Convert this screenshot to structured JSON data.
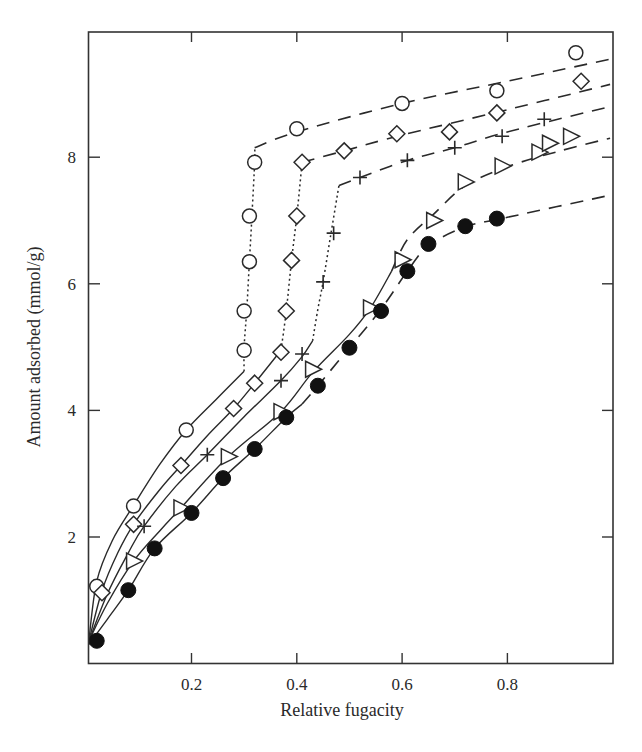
{
  "chart_data": {
    "type": "scatter",
    "title": "",
    "xlabel": "Relative fugacity",
    "ylabel": "Amount adsorbed (mmol/g)",
    "xlim": [
      0,
      1.0
    ],
    "ylim": [
      0,
      10
    ],
    "x_ticks": [
      0.2,
      0.4,
      0.6,
      0.8
    ],
    "x_tick_labels": [
      "0.2",
      "0.4",
      "0.6",
      "0.8"
    ],
    "y_ticks": [
      2,
      4,
      6,
      8
    ],
    "y_tick_labels": [
      "2",
      "4",
      "6",
      "8"
    ],
    "grid": false,
    "legend": null,
    "line_styles": {
      "fit_low": "solid",
      "condensation_step": "dotted",
      "fit_high": "dashed"
    },
    "series": [
      {
        "name": "open-circle",
        "marker": "circle-open",
        "points": [
          [
            0.02,
            1.22
          ],
          [
            0.09,
            2.49
          ],
          [
            0.19,
            3.69
          ],
          [
            0.3,
            4.95
          ],
          [
            0.3,
            5.57
          ],
          [
            0.31,
            6.35
          ],
          [
            0.31,
            7.07
          ],
          [
            0.32,
            7.92
          ],
          [
            0.4,
            8.45
          ],
          [
            0.6,
            8.85
          ],
          [
            0.78,
            9.05
          ],
          [
            0.93,
            9.65
          ]
        ],
        "solid_curve": [
          [
            0.005,
            0.35
          ],
          [
            0.02,
            1.3
          ],
          [
            0.05,
            1.95
          ],
          [
            0.09,
            2.5
          ],
          [
            0.14,
            3.15
          ],
          [
            0.19,
            3.69
          ],
          [
            0.25,
            4.2
          ],
          [
            0.3,
            4.62
          ]
        ],
        "dotted_curve": [
          [
            0.3,
            4.62
          ],
          [
            0.3,
            5.0
          ],
          [
            0.305,
            5.6
          ],
          [
            0.31,
            6.35
          ],
          [
            0.315,
            7.1
          ],
          [
            0.32,
            7.92
          ],
          [
            0.32,
            8.15
          ]
        ],
        "dashed_curve": [
          [
            0.32,
            8.15
          ],
          [
            0.4,
            8.4
          ],
          [
            0.6,
            8.85
          ],
          [
            0.8,
            9.2
          ],
          [
            0.995,
            9.55
          ]
        ]
      },
      {
        "name": "open-diamond",
        "marker": "diamond-open",
        "points": [
          [
            0.03,
            1.12
          ],
          [
            0.09,
            2.2
          ],
          [
            0.18,
            3.13
          ],
          [
            0.28,
            4.03
          ],
          [
            0.32,
            4.43
          ],
          [
            0.37,
            4.92
          ],
          [
            0.38,
            5.57
          ],
          [
            0.39,
            6.37
          ],
          [
            0.4,
            7.07
          ],
          [
            0.41,
            7.92
          ],
          [
            0.49,
            8.1
          ],
          [
            0.59,
            8.37
          ],
          [
            0.69,
            8.4
          ],
          [
            0.78,
            8.7
          ],
          [
            0.94,
            9.2
          ]
        ],
        "solid_curve": [
          [
            0.005,
            0.35
          ],
          [
            0.03,
            1.15
          ],
          [
            0.06,
            1.75
          ],
          [
            0.09,
            2.2
          ],
          [
            0.14,
            2.75
          ],
          [
            0.18,
            3.13
          ],
          [
            0.23,
            3.6
          ],
          [
            0.28,
            4.03
          ],
          [
            0.32,
            4.43
          ],
          [
            0.37,
            4.95
          ]
        ],
        "dotted_curve": [
          [
            0.37,
            4.95
          ],
          [
            0.38,
            5.57
          ],
          [
            0.39,
            6.37
          ],
          [
            0.4,
            7.07
          ],
          [
            0.41,
            7.92
          ]
        ],
        "dashed_curve": [
          [
            0.41,
            7.92
          ],
          [
            0.49,
            8.1
          ],
          [
            0.6,
            8.35
          ],
          [
            0.8,
            8.75
          ],
          [
            0.995,
            9.15
          ]
        ]
      },
      {
        "name": "plus",
        "marker": "plus",
        "points": [
          [
            0.11,
            2.17
          ],
          [
            0.23,
            3.3
          ],
          [
            0.37,
            4.47
          ],
          [
            0.41,
            4.89
          ],
          [
            0.45,
            6.03
          ],
          [
            0.47,
            6.8
          ],
          [
            0.52,
            7.68
          ],
          [
            0.61,
            7.95
          ],
          [
            0.7,
            8.15
          ],
          [
            0.79,
            8.33
          ],
          [
            0.87,
            8.6
          ]
        ],
        "solid_curve": [
          [
            0.005,
            0.35
          ],
          [
            0.04,
            1.1
          ],
          [
            0.08,
            1.75
          ],
          [
            0.11,
            2.17
          ],
          [
            0.17,
            2.8
          ],
          [
            0.23,
            3.3
          ],
          [
            0.3,
            3.9
          ],
          [
            0.37,
            4.47
          ],
          [
            0.41,
            4.85
          ],
          [
            0.43,
            5.1
          ]
        ],
        "dotted_curve": [
          [
            0.43,
            5.1
          ],
          [
            0.44,
            5.6
          ],
          [
            0.45,
            6.03
          ],
          [
            0.465,
            6.8
          ],
          [
            0.48,
            7.55
          ]
        ],
        "dashed_curve": [
          [
            0.48,
            7.55
          ],
          [
            0.52,
            7.68
          ],
          [
            0.61,
            7.95
          ],
          [
            0.7,
            8.15
          ],
          [
            0.8,
            8.4
          ],
          [
            0.995,
            8.8
          ]
        ]
      },
      {
        "name": "open-triangle",
        "marker": "triangle-right-open",
        "points": [
          [
            0.09,
            1.62
          ],
          [
            0.18,
            2.46
          ],
          [
            0.27,
            3.27
          ],
          [
            0.37,
            3.98
          ],
          [
            0.43,
            4.65
          ],
          [
            0.54,
            5.62
          ],
          [
            0.6,
            6.38
          ],
          [
            0.66,
            7.0
          ],
          [
            0.72,
            7.61
          ],
          [
            0.79,
            7.86
          ],
          [
            0.86,
            8.08
          ],
          [
            0.88,
            8.22
          ],
          [
            0.92,
            8.33
          ]
        ],
        "solid_curve": [
          [
            0.005,
            0.35
          ],
          [
            0.04,
            0.95
          ],
          [
            0.09,
            1.62
          ],
          [
            0.14,
            2.1
          ],
          [
            0.18,
            2.46
          ],
          [
            0.27,
            3.27
          ],
          [
            0.37,
            3.98
          ],
          [
            0.43,
            4.6
          ],
          [
            0.5,
            5.2
          ],
          [
            0.54,
            5.62
          ],
          [
            0.58,
            6.2
          ]
        ],
        "dotted_curve": [],
        "dashed_curve": [
          [
            0.58,
            6.2
          ],
          [
            0.61,
            6.7
          ],
          [
            0.66,
            7.1
          ],
          [
            0.72,
            7.55
          ],
          [
            0.8,
            7.85
          ],
          [
            0.9,
            8.1
          ],
          [
            0.995,
            8.3
          ]
        ]
      },
      {
        "name": "filled-circle",
        "marker": "circle-filled",
        "points": [
          [
            0.02,
            0.36
          ],
          [
            0.08,
            1.16
          ],
          [
            0.13,
            1.82
          ],
          [
            0.2,
            2.38
          ],
          [
            0.26,
            2.93
          ],
          [
            0.32,
            3.39
          ],
          [
            0.38,
            3.89
          ],
          [
            0.44,
            4.39
          ],
          [
            0.5,
            4.99
          ],
          [
            0.56,
            5.57
          ],
          [
            0.61,
            6.2
          ],
          [
            0.65,
            6.63
          ],
          [
            0.72,
            6.91
          ],
          [
            0.78,
            7.03
          ]
        ],
        "solid_curve": [
          [
            0.005,
            0.3
          ],
          [
            0.04,
            0.7
          ],
          [
            0.08,
            1.16
          ],
          [
            0.13,
            1.82
          ],
          [
            0.2,
            2.38
          ],
          [
            0.26,
            2.93
          ],
          [
            0.32,
            3.39
          ],
          [
            0.38,
            3.89
          ],
          [
            0.41,
            4.1
          ]
        ],
        "dotted_curve": [],
        "dashed_curve": [
          [
            0.41,
            4.1
          ],
          [
            0.44,
            4.39
          ],
          [
            0.5,
            4.99
          ],
          [
            0.56,
            5.6
          ],
          [
            0.61,
            6.2
          ],
          [
            0.65,
            6.6
          ],
          [
            0.72,
            6.9
          ],
          [
            0.8,
            7.05
          ],
          [
            0.995,
            7.4
          ]
        ]
      }
    ]
  },
  "axes": {
    "x_title": "Relative fugacity",
    "y_title": "Amount adsorbed (mmol/g)"
  }
}
